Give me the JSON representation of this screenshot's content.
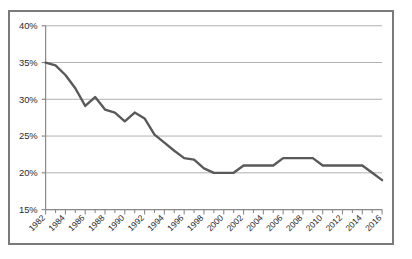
{
  "figure": {
    "frame_border_color": "#7a7a7a",
    "background_color": "#ffffff"
  },
  "caption": {
    "text": ""
  },
  "chart_data": {
    "type": "line",
    "title": "",
    "subtitle": "",
    "xlabel": "",
    "ylabel": "",
    "ylim": [
      15,
      40
    ],
    "xlim": [
      1982,
      2016
    ],
    "grid": true,
    "grid_axis": "y",
    "legend": false,
    "legend_position": "none",
    "line_color": "#595959",
    "line_width": 2.4,
    "y_tick_labels": [
      "40%",
      "35%",
      "30%",
      "25%",
      "20%",
      "15%"
    ],
    "y_tick_values": [
      40,
      35,
      30,
      25,
      20,
      15
    ],
    "x_tick_labels": [
      "1982",
      "1984",
      "1986",
      "1988",
      "1990",
      "1992",
      "1994",
      "1996",
      "1998",
      "2000",
      "2002",
      "2004",
      "2006",
      "2008",
      "2010",
      "2012",
      "2014",
      "2016"
    ],
    "x_tick_values": [
      1982,
      1984,
      1986,
      1988,
      1990,
      1992,
      1994,
      1996,
      1998,
      2000,
      2002,
      2004,
      2006,
      2008,
      2010,
      2012,
      2014,
      2016
    ],
    "x_minor_ticks_every": 1,
    "x_label_rotation_deg": -45,
    "x": [
      1982,
      1983,
      1984,
      1985,
      1986,
      1987,
      1988,
      1989,
      1990,
      1991,
      1992,
      1993,
      1994,
      1995,
      1996,
      1997,
      1998,
      1999,
      2000,
      2001,
      2002,
      2003,
      2004,
      2005,
      2006,
      2007,
      2008,
      2009,
      2010,
      2011,
      2012,
      2013,
      2014,
      2015,
      2016
    ],
    "values": [
      35.0,
      34.6,
      33.3,
      31.5,
      29.1,
      30.3,
      28.6,
      28.2,
      27.0,
      28.2,
      27.4,
      25.2,
      24.1,
      23.0,
      22.0,
      21.8,
      20.6,
      20.0,
      20.0,
      20.0,
      21.0,
      21.0,
      21.0,
      21.0,
      22.0,
      22.0,
      22.0,
      22.0,
      21.0,
      21.0,
      21.0,
      21.0,
      21.0,
      20.0,
      19.0
    ],
    "series": [
      {
        "name": "series-1",
        "values": [
          35.0,
          34.6,
          33.3,
          31.5,
          29.1,
          30.3,
          28.6,
          28.2,
          27.0,
          28.2,
          27.4,
          25.2,
          24.1,
          23.0,
          22.0,
          21.8,
          20.6,
          20.0,
          20.0,
          20.0,
          21.0,
          21.0,
          21.0,
          21.0,
          22.0,
          22.0,
          22.0,
          22.0,
          21.0,
          21.0,
          21.0,
          21.0,
          21.0,
          20.0,
          19.0
        ]
      }
    ]
  }
}
